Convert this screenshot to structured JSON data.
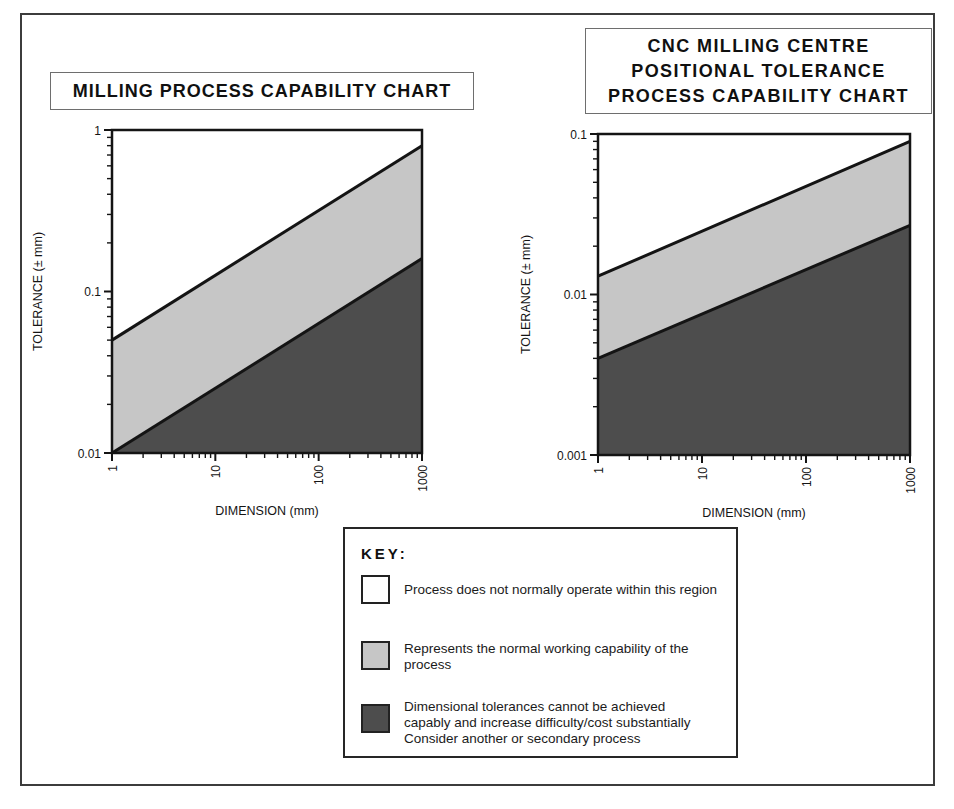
{
  "chart_data": [
    {
      "type": "area",
      "title": "MILLING PROCESS CAPABILITY CHART",
      "title_lines": [
        "MILLING PROCESS CAPABILITY CHART"
      ],
      "xlabel": "DIMENSION (mm)",
      "ylabel": "TOLERANCE (± mm)",
      "xscale": "log",
      "yscale": "log",
      "xlim": [
        1,
        1000
      ],
      "ylim": [
        0.01,
        1
      ],
      "x_ticks": [
        "1",
        "10",
        "100",
        "1000"
      ],
      "y_ticks": [
        "1",
        "0.1",
        "0.01"
      ],
      "grid": false,
      "legend_position": "separate-key-box",
      "series": [
        {
          "name": "upper-capability-boundary",
          "x": [
            1,
            1000
          ],
          "y": [
            0.05,
            0.8
          ]
        },
        {
          "name": "lower-capability-boundary",
          "x": [
            1,
            1000
          ],
          "y": [
            0.01,
            0.16
          ]
        }
      ],
      "regions": [
        {
          "name": "above-upper-boundary",
          "fill": "#ffffff",
          "meaning": "Process does not normally operate within this region"
        },
        {
          "name": "between-boundaries",
          "fill": "#c6c6c6",
          "meaning": "Represents the normal working capability of the process"
        },
        {
          "name": "below-lower-boundary",
          "fill": "#4d4d4d",
          "meaning": "Dimensional tolerances cannot be achieved capably and increase difficulty/cost substantially Consider another or secondary process"
        }
      ]
    },
    {
      "type": "area",
      "title": "CNC MILLING CENTRE POSITIONAL TOLERANCE PROCESS CAPABILITY CHART",
      "title_lines": [
        "CNC MILLING CENTRE",
        "POSITIONAL TOLERANCE",
        "PROCESS CAPABILITY CHART"
      ],
      "xlabel": "DIMENSION (mm)",
      "ylabel": "TOLERANCE (± mm)",
      "xscale": "log",
      "yscale": "log",
      "xlim": [
        1,
        1000
      ],
      "ylim": [
        0.001,
        0.1
      ],
      "x_ticks": [
        "1",
        "10",
        "100",
        "1000"
      ],
      "y_ticks": [
        "0.1",
        "0.01",
        "0.001"
      ],
      "grid": false,
      "legend_position": "separate-key-box",
      "series": [
        {
          "name": "upper-capability-boundary",
          "x": [
            1,
            1000
          ],
          "y": [
            0.013,
            0.09
          ]
        },
        {
          "name": "lower-capability-boundary",
          "x": [
            1,
            1000
          ],
          "y": [
            0.004,
            0.027
          ]
        }
      ],
      "regions": [
        {
          "name": "above-upper-boundary",
          "fill": "#ffffff",
          "meaning": "Process does not normally operate within this region"
        },
        {
          "name": "between-boundaries",
          "fill": "#c6c6c6",
          "meaning": "Represents the normal working capability of the process"
        },
        {
          "name": "below-lower-boundary",
          "fill": "#4d4d4d",
          "meaning": "Dimensional tolerances cannot be achieved capably and increase difficulty/cost substantially Consider another or secondary process"
        }
      ]
    }
  ],
  "key": {
    "heading": "KEY:",
    "items": [
      {
        "swatch_color": "#ffffff",
        "lines": [
          "Process does not normally operate within this region"
        ]
      },
      {
        "swatch_color": "#c6c6c6",
        "lines": [
          "Represents the normal working capability of the",
          "process"
        ]
      },
      {
        "swatch_color": "#4d4d4d",
        "lines": [
          "Dimensional tolerances cannot be achieved",
          "capably and increase difficulty/cost substantially",
          "Consider another or secondary process"
        ]
      }
    ]
  },
  "colors": {
    "normal_region": "#c6c6c6",
    "difficult_region": "#4d4d4d",
    "boundary_line": "#141414",
    "outer_frame": "#3c3c3c"
  }
}
